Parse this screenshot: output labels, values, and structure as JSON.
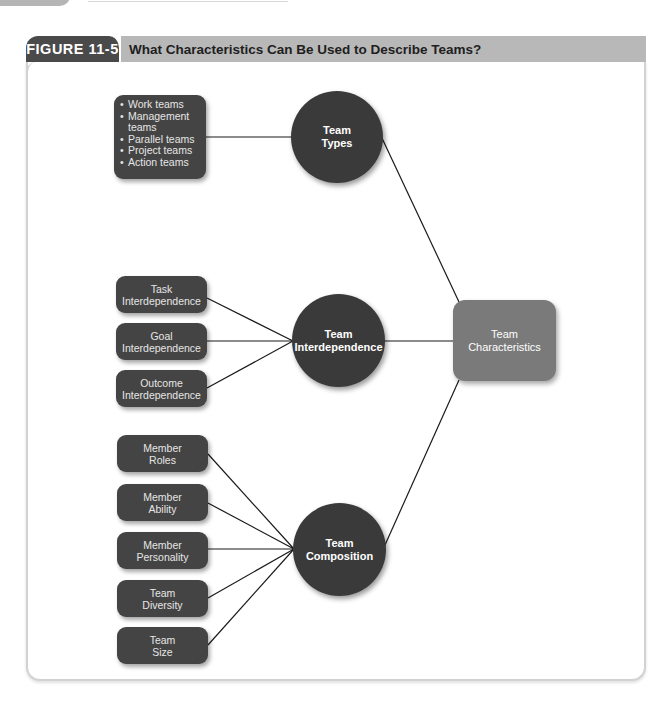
{
  "figure": {
    "label": "FIGURE 11-5",
    "title": "What Characteristics Can Be Used to Describe Teams?"
  },
  "diagram": {
    "central_node": {
      "line1": "Team",
      "line2": "Characteristics"
    },
    "hubs": [
      {
        "id": "types",
        "line1": "Team",
        "line2": "Types"
      },
      {
        "id": "interdependence",
        "line1": "Team",
        "line2": "Interdependence"
      },
      {
        "id": "composition",
        "line1": "Team",
        "line2": "Composition"
      }
    ],
    "team_types_list": {
      "items": [
        "Work teams",
        "Management",
        "teams",
        "Parallel teams",
        "Project teams",
        "Action teams"
      ]
    },
    "interdependence_items": [
      {
        "line1": "Task",
        "line2": "Interdependence"
      },
      {
        "line1": "Goal",
        "line2": "Interdependence"
      },
      {
        "line1": "Outcome",
        "line2": "Interdependence"
      }
    ],
    "composition_items": [
      {
        "line1": "Member",
        "line2": "Roles"
      },
      {
        "line1": "Member",
        "line2": "Ability"
      },
      {
        "line1": "Member",
        "line2": "Personality"
      },
      {
        "line1": "Team",
        "line2": "Diversity"
      },
      {
        "line1": "Team",
        "line2": "Size"
      }
    ]
  },
  "colors": {
    "figure_label_bg": "#4a4a4a",
    "title_bar_bg": "#b8b8b8",
    "node_dark": "#3a3a3a",
    "box_dark": "#444444",
    "central_node_bg": "#7a7a7a",
    "connector": "#1a1a1a"
  }
}
